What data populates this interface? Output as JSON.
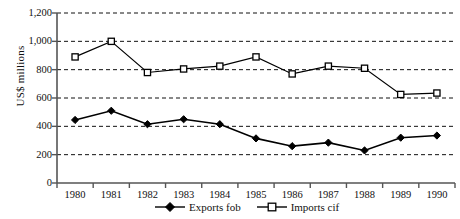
{
  "chart_data": {
    "type": "line",
    "title": "",
    "xlabel": "",
    "ylabel": "US$ millions",
    "categories": [
      "1980",
      "1981",
      "1982",
      "1983",
      "1984",
      "1985",
      "1986",
      "1987",
      "1988",
      "1989",
      "1990"
    ],
    "ylim": [
      0,
      1200
    ],
    "ytick_labels": [
      "0",
      "200",
      "400",
      "600",
      "800",
      "1,000",
      "1,200"
    ],
    "ytick_values": [
      0,
      200,
      400,
      600,
      800,
      1000,
      1200
    ],
    "grid": "horizontal-dashed",
    "legend_position": "bottom-center",
    "series": [
      {
        "name": "Exports fob",
        "marker": "filled-diamond",
        "values": [
          445,
          510,
          415,
          450,
          415,
          315,
          260,
          285,
          230,
          320,
          335
        ]
      },
      {
        "name": "Imports cif",
        "marker": "open-square",
        "values": [
          890,
          1000,
          780,
          805,
          825,
          890,
          770,
          825,
          810,
          625,
          635
        ]
      }
    ]
  },
  "axis": {
    "y_title": "US$ millions"
  }
}
